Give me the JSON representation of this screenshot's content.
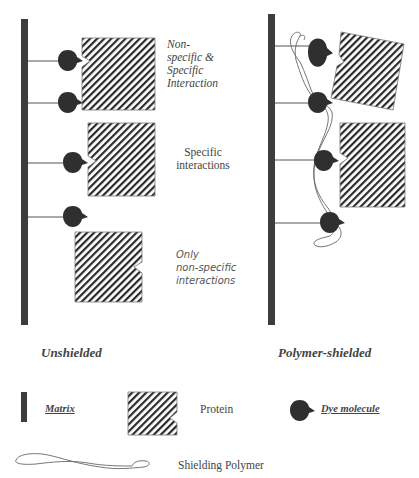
{
  "panels": {
    "unshielded": {
      "title": "Unshielded",
      "annotations": {
        "top": [
          "Non-",
          "specific &",
          "Specific",
          "Interaction"
        ],
        "middle": [
          "Specific",
          "interactions"
        ],
        "bottom": [
          "Only",
          "non-specific",
          "interactions"
        ]
      }
    },
    "shielded": {
      "title": "Polymer-shielded"
    }
  },
  "legend": {
    "matrix": "Matrix",
    "protein": "Protein",
    "dye": "Dye molecule",
    "polymer": "Shielding Polymer"
  },
  "colors": {
    "matrix": "#3d3d3d",
    "dye": "#2f2f2f",
    "hatch": "#2a2a2a",
    "polymer": "#555555",
    "text": "#444444"
  }
}
